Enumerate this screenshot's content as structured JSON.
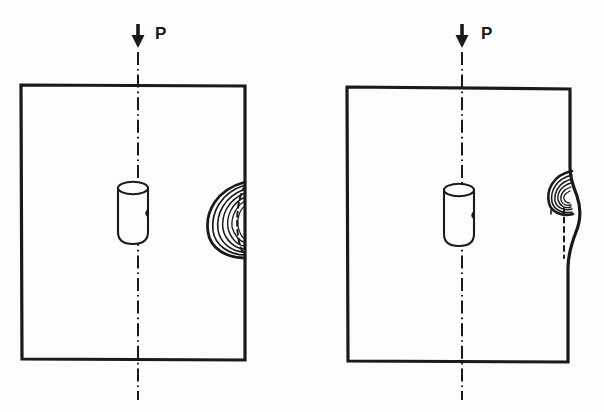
{
  "figure": {
    "kind": "technical-line-drawing",
    "background_color": "#fdfdfd",
    "ink_color": "#1a1a1a",
    "panel_count": 2
  },
  "panels": [
    {
      "id": "panel-left",
      "name": "left-panel",
      "stage_label": "",
      "plate": {
        "x": 21,
        "y": 85,
        "width": 224,
        "height": 275,
        "stroke_width": 3,
        "right_edge_straight": true
      },
      "load": {
        "symbol": "downward-arrow",
        "label": "P",
        "label_x": 155,
        "label_y": 25,
        "arrow_x": 138,
        "arrow_top_y": 25,
        "arrow_tip_y": 48
      },
      "centerline": {
        "x": 138,
        "top_y": 52,
        "bottom_y": 400,
        "style": "dash-dot",
        "stroke_width": 2
      },
      "hole": {
        "shape": "cylinder",
        "center_x": 133,
        "top_y": 188,
        "bottom_y": 237,
        "radius_x": 15,
        "ellipse_ry": 6,
        "stroke_width": 2
      },
      "crack": {
        "type": "lens-shaped-plastic-zone",
        "edge_x": 245,
        "top_y": 182,
        "bottom_y": 258,
        "max_depth": 38,
        "curve_count": 6,
        "reference_line_style": "dashed",
        "reference_line_x": 245,
        "notes": "Nested crescent contours bulging inward from the right edge; dashed arc marks the original edge location."
      }
    },
    {
      "id": "panel-right",
      "name": "right-panel",
      "stage_label": "",
      "plate": {
        "x": 347,
        "y": 87,
        "width": 223,
        "height": 275,
        "stroke_width": 3,
        "right_edge_straight": false
      },
      "load": {
        "symbol": "downward-arrow",
        "label": "P",
        "label_x": 481,
        "label_y": 25,
        "arrow_x": 462,
        "arrow_top_y": 25,
        "arrow_tip_y": 48
      },
      "centerline": {
        "x": 462,
        "top_y": 52,
        "bottom_y": 400,
        "style": "dash-dot",
        "stroke_width": 2
      },
      "hole": {
        "shape": "cylinder",
        "center_x": 459,
        "top_y": 190,
        "bottom_y": 239,
        "radius_x": 15,
        "ellipse_ry": 6,
        "stroke_width": 2
      },
      "crack": {
        "type": "lens-shaped-plastic-zone-with-edge-bulge",
        "edge_x": 570,
        "top_y": 171,
        "bottom_y": 214,
        "max_depth": 24,
        "curve_count": 6,
        "reference_line_style": "dashed",
        "reference_line_x": 564,
        "edge_bulge": {
          "present": true,
          "start_y": 168,
          "end_y": 283,
          "max_outward_x": 580,
          "notes": "The free edge bows outward in an S-curve below the crack zone."
        }
      }
    }
  ],
  "labels": {
    "load_left": "P",
    "load_right": "P"
  }
}
